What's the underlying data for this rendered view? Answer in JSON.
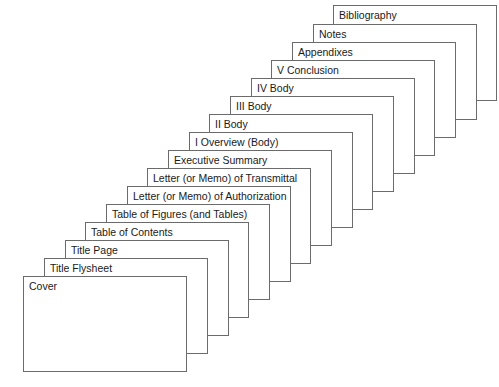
{
  "diagram": {
    "type": "stacked-cards",
    "canvas": {
      "width": 499,
      "height": 387
    },
    "style": {
      "background_color": "#ffffff",
      "card_fill_color": "#ffffff",
      "card_border_color": "#6b6b6b",
      "label_text_color": "#1a1a1a",
      "card_width": 164,
      "card_height": 96,
      "step_x": 20.7,
      "step_y": -18.0,
      "base_left": 23,
      "base_top": 276
    },
    "cards": [
      {
        "label": "Cover",
        "order": 1,
        "left": 23,
        "top": 276
      },
      {
        "label": "Title Flysheet",
        "order": 2,
        "left": 44,
        "top": 258
      },
      {
        "label": "Title Page",
        "order": 3,
        "left": 65,
        "top": 240
      },
      {
        "label": "Table of Contents",
        "order": 4,
        "left": 85,
        "top": 222
      },
      {
        "label": "Table of Figures (and Tables)",
        "order": 5,
        "left": 106,
        "top": 204
      },
      {
        "label": "Letter (or Memo) of Authorization",
        "order": 6,
        "left": 127,
        "top": 186
      },
      {
        "label": "Letter (or Memo) of Transmittal",
        "order": 7,
        "left": 147,
        "top": 168
      },
      {
        "label": "Executive Summary",
        "order": 8,
        "left": 168,
        "top": 150
      },
      {
        "label": "I Overview (Body)",
        "order": 9,
        "left": 189,
        "top": 132
      },
      {
        "label": "II Body",
        "order": 10,
        "left": 209,
        "top": 114
      },
      {
        "label": "III Body",
        "order": 11,
        "left": 230,
        "top": 96
      },
      {
        "label": "IV Body",
        "order": 12,
        "left": 251,
        "top": 78
      },
      {
        "label": "V Conclusion",
        "order": 13,
        "left": 271,
        "top": 60
      },
      {
        "label": "Appendixes",
        "order": 14,
        "left": 292,
        "top": 42
      },
      {
        "label": "Notes",
        "order": 15,
        "left": 313,
        "top": 24
      },
      {
        "label": "Bibliography",
        "order": 16,
        "left": 333,
        "top": 5
      }
    ]
  }
}
